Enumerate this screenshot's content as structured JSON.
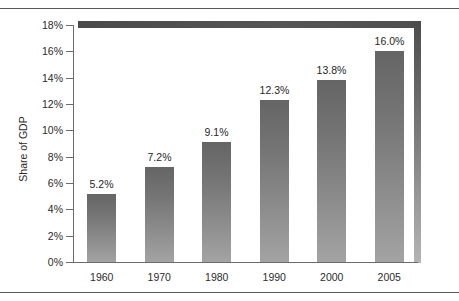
{
  "chart_data": {
    "type": "bar",
    "title": "",
    "xlabel": "",
    "ylabel": "Share of GDP",
    "categories": [
      "1960",
      "1970",
      "1980",
      "1990",
      "2000",
      "2005"
    ],
    "values": [
      5.2,
      7.2,
      9.1,
      12.3,
      13.8,
      16.0
    ],
    "value_labels": [
      "5.2%",
      "7.2%",
      "9.1%",
      "12.3%",
      "13.8%",
      "16.0%"
    ],
    "ylim": [
      0,
      18
    ],
    "ytick_values": [
      0,
      2,
      4,
      6,
      8,
      10,
      12,
      14,
      16,
      18
    ],
    "ytick_labels": [
      "0%",
      "2%",
      "4%",
      "6%",
      "8%",
      "10%",
      "12%",
      "14%",
      "16%",
      "18%"
    ],
    "grid": false,
    "legend": null,
    "series": [
      {
        "name": "Share of GDP",
        "values": [
          5.2,
          7.2,
          9.1,
          12.3,
          13.8,
          16.0
        ]
      }
    ],
    "colors": {
      "bar_top": "#656565",
      "bar_bottom": "#a3a3a3",
      "axis": "#6b6b6b",
      "text": "#2b2b2b",
      "frame": "#4c4c4c",
      "background": "#ffffff"
    }
  }
}
